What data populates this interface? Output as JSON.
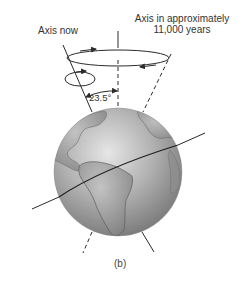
{
  "figure": {
    "caption": "(b)",
    "labels": {
      "axis_now": "Axis now",
      "axis_future_line1": "Axis in approximately",
      "axis_future_line2": "11,000 years",
      "tilt_angle": "23.5°"
    },
    "colors": {
      "line": "#2a2a2a",
      "globe_light": "#d8d8d8",
      "globe_dark": "#7a7a7a",
      "land": "#9a9a9a",
      "text": "#333333"
    },
    "elements": {
      "globe": {
        "cx": 118,
        "cy": 172,
        "r": 64
      },
      "vertical_axis": {
        "x": 118,
        "y_top": 31,
        "y_bottom": 108
      },
      "current_axis": {
        "from": [
          63,
          45
        ],
        "to": [
          92,
          112
        ],
        "bottom_from": [
          142,
          232
        ],
        "bottom_to": [
          154,
          252
        ]
      },
      "future_axis": {
        "from": [
          171,
          54
        ],
        "to": [
          143,
          112
        ],
        "bottom_from": [
          92,
          232
        ],
        "bottom_to": [
          83,
          253
        ]
      },
      "precession_circle": {
        "cx": 118,
        "cy": 58,
        "rx": 51,
        "ry": 8
      },
      "spin_circle": {
        "cx": 80,
        "cy": 79,
        "rx": 15,
        "ry": 7
      },
      "ecliptic_line": {
        "from": [
          32,
          209
        ],
        "to": [
          205,
          133
        ]
      }
    }
  }
}
